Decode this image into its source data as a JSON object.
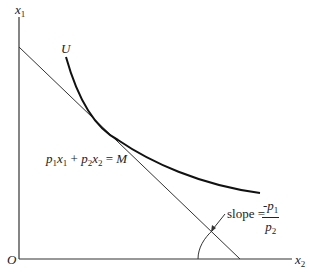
{
  "diagram": {
    "type": "consumer-choice",
    "axes": {
      "y_label": "x",
      "y_label_sub": "1",
      "x_label": "x",
      "x_label_sub": "2",
      "origin_label": "O"
    },
    "indifference_curve": {
      "label": "U"
    },
    "budget_line": {
      "equation_parts": {
        "p1": "p",
        "p1_sub": "1",
        "x1": "x",
        "x1_sub": "1",
        "plus": " + ",
        "p2": "p",
        "p2_sub": "2",
        "x2": "x",
        "x2_sub": "2",
        "eq": " = ",
        "M": "M"
      },
      "equation_text": "p1x1 + p2x2 = M"
    },
    "slope_annotation": {
      "label": "slope =",
      "numerator": "-p",
      "numerator_sub": "1",
      "denominator": "p",
      "denominator_sub": "2"
    },
    "colors": {
      "ink": "#222222",
      "background": "#ffffff"
    }
  }
}
